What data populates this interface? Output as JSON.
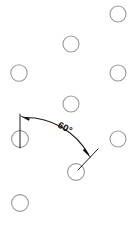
{
  "figure": {
    "type": "geometric-angle-diagram",
    "width": 137,
    "height": 226,
    "background_color": "#ffffff"
  },
  "annotation": {
    "angle_label": "60°",
    "angle_value": 60,
    "angle_unit": "degrees",
    "label_color": "#0d0d0d",
    "arc_color": "#1c1c1c",
    "vertex": {
      "x": 20,
      "y": 139
    },
    "reference_line": {
      "x1": 20,
      "y1": 139,
      "x2": 20,
      "y2": 116
    },
    "start_arrow": {
      "x": 22,
      "y": 116,
      "direction": "left"
    },
    "end_arrow": {
      "x": 88,
      "y": 153,
      "direction": "down-right"
    },
    "radial_line": {
      "x1": 76,
      "y1": 172,
      "x2": 97,
      "y2": 150
    },
    "arc": {
      "start_x": 24,
      "start_y": 117,
      "end_x": 87,
      "end_y": 155,
      "radius": 72
    }
  },
  "nodes": {
    "stroke_color": "#9a9a9a",
    "fill": "none",
    "radius": 8,
    "count": 9,
    "items": [
      {
        "id": "node-top-right",
        "x": 118,
        "y": 14,
        "r": 8.0
      },
      {
        "id": "node-top-center",
        "x": 71,
        "y": 44,
        "r": 8.0
      },
      {
        "id": "node-mid-left",
        "x": 19,
        "y": 73,
        "r": 8.2
      },
      {
        "id": "node-mid-right",
        "x": 118,
        "y": 73,
        "r": 8.0
      },
      {
        "id": "node-center",
        "x": 71,
        "y": 104,
        "r": 8.0
      },
      {
        "id": "node-vertex-left",
        "x": 20,
        "y": 139,
        "r": 8.4
      },
      {
        "id": "node-right-lower",
        "x": 118,
        "y": 139,
        "r": 8.0
      },
      {
        "id": "node-arc-end",
        "x": 76,
        "y": 172,
        "r": 8.4
      },
      {
        "id": "node-bottom-left",
        "x": 20,
        "y": 203,
        "r": 8.4
      }
    ]
  }
}
